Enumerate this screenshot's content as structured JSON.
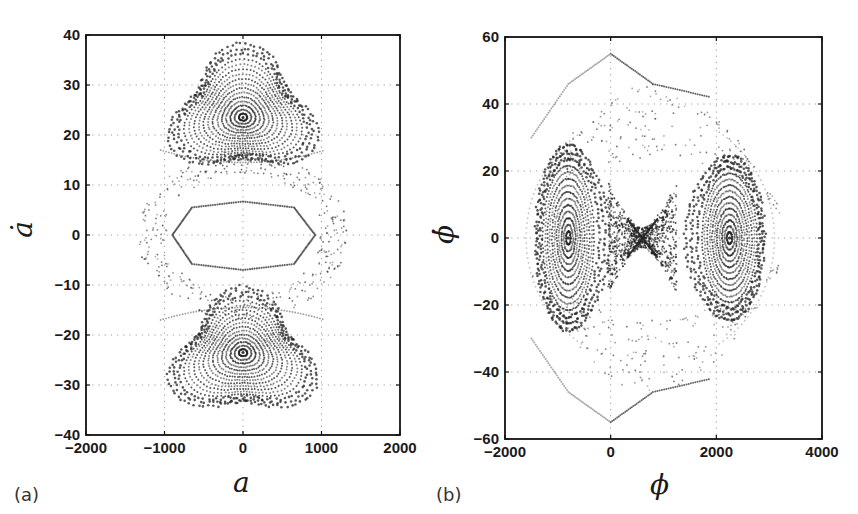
{
  "figure": {
    "panels": [
      {
        "tag": "(a)",
        "xlabel": "a",
        "ylabel": "ȧ"
      },
      {
        "tag": "(b)",
        "xlabel": "ϕ",
        "ylabel": "ϕ̇"
      }
    ]
  },
  "chart_data": [
    {
      "type": "scatter",
      "title": "",
      "panel": "(a)",
      "xlabel": "a",
      "ylabel": "ȧ (a-dot)",
      "xlim": [
        -2000,
        2000
      ],
      "ylim": [
        -40,
        40
      ],
      "xticks": [
        -2000,
        -1000,
        0,
        1000,
        2000
      ],
      "yticks": [
        -40,
        -30,
        -20,
        -10,
        0,
        10,
        20,
        30,
        40
      ],
      "xtick_labels": [
        "−2000",
        "−1000",
        "0",
        "1000",
        "2000"
      ],
      "ytick_labels": [
        "40",
        "30",
        "20",
        "10",
        "0",
        "−10",
        "−20",
        "−30",
        "−40"
      ],
      "grid": true,
      "grid_style": "dotted",
      "legend": "none",
      "description": "Phase portrait (Poincaré-like section) with two rounded-triangular islands of closed orbits centered at (0, ±23.5), a central hexagon-like closed orbit around the origin, and a sparse chaotic band between them.",
      "features": [
        {
          "name": "upper island",
          "center": [
            0,
            23.5
          ],
          "x_range": [
            -850,
            850
          ],
          "y_range": [
            15,
            36
          ],
          "shape": "rounded triangle (apex up)"
        },
        {
          "name": "lower island",
          "center": [
            0,
            -23.5
          ],
          "x_range": [
            -850,
            850
          ],
          "y_range": [
            -36,
            -15
          ],
          "shape": "rounded triangle (apex down)"
        },
        {
          "name": "central orbit",
          "center": [
            0,
            0
          ],
          "vertices": [
            [
              -900,
              0
            ],
            [
              -650,
              5.5
            ],
            [
              0,
              6.7
            ],
            [
              650,
              5.5
            ],
            [
              920,
              0
            ],
            [
              650,
              -5.8
            ],
            [
              0,
              -7
            ],
            [
              -650,
              -5.8
            ]
          ]
        },
        {
          "name": "chaotic band",
          "x_range": [
            -1350,
            1400
          ],
          "y_range": [
            -17,
            17
          ]
        }
      ]
    },
    {
      "type": "scatter",
      "title": "",
      "panel": "(b)",
      "xlabel": "ϕ",
      "ylabel": "ϕ̇ (phi-dot)",
      "xlim": [
        -2000,
        4000
      ],
      "ylim": [
        -60,
        60
      ],
      "xticks": [
        -2000,
        0,
        2000,
        4000
      ],
      "yticks": [
        -60,
        -40,
        -20,
        0,
        20,
        40,
        60
      ],
      "xtick_labels": [
        "−2000",
        "0",
        "2000",
        "4000"
      ],
      "ytick_labels": [
        "60",
        "40",
        "20",
        "0",
        "−20",
        "−40",
        "−60"
      ],
      "grid": true,
      "grid_style": "dotted",
      "legend": "none",
      "description": "Phase portrait with two elliptic islands of closed orbits centered near (-800, 0) and (2250, 0), a hyperbolic X-point near (600, 0) with dense separatrix region, and outer sparse orbits reaching about ±55.",
      "features": [
        {
          "name": "left island",
          "center": [
            -800,
            0
          ],
          "x_range": [
            -1400,
            -150
          ],
          "y_range": [
            -28,
            28
          ]
        },
        {
          "name": "right island",
          "center": [
            2250,
            0
          ],
          "x_range": [
            1500,
            2900
          ],
          "y_range": [
            -25,
            25
          ]
        },
        {
          "name": "hyperbolic point",
          "center": [
            600,
            0
          ]
        },
        {
          "name": "outer orbit top",
          "points": [
            [
              -1500,
              30
            ],
            [
              -800,
              46
            ],
            [
              0,
              55
            ],
            [
              800,
              46
            ],
            [
              1900,
              42
            ]
          ]
        },
        {
          "name": "outer orbit bottom",
          "points": [
            [
              -1500,
              -30
            ],
            [
              -800,
              -46
            ],
            [
              0,
              -55
            ],
            [
              800,
              -46
            ],
            [
              1900,
              -42
            ]
          ]
        }
      ]
    }
  ]
}
